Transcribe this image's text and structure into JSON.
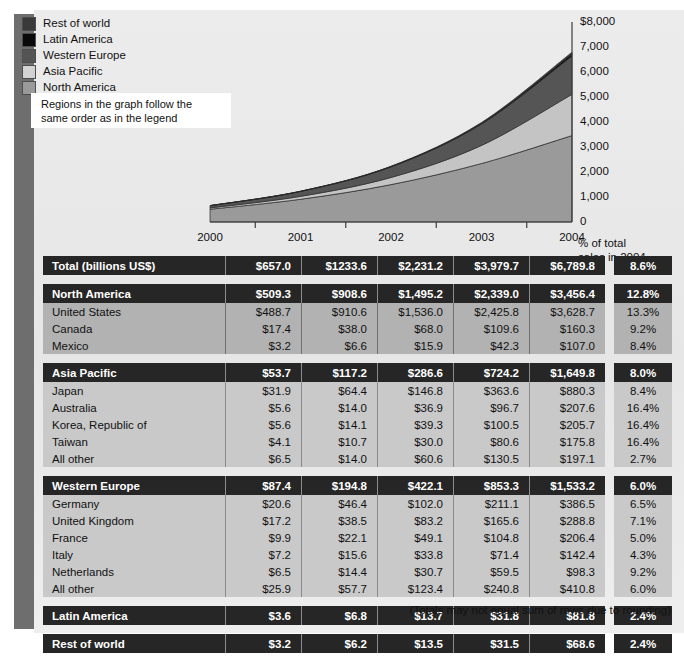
{
  "legend": {
    "items": [
      {
        "label": "Rest of world",
        "color": "#3a3a3a"
      },
      {
        "label": "Latin America",
        "color": "#0a0a0a"
      },
      {
        "label": "Western Europe",
        "color": "#555555"
      },
      {
        "label": "Asia Pacific",
        "color": "#d2d2d2"
      },
      {
        "label": "North America",
        "color": "#9a9a9a"
      }
    ]
  },
  "note": {
    "line1": "Regions in the graph follow the",
    "line2": "same order as in the legend"
  },
  "chart_data": {
    "type": "area",
    "title": "",
    "xlabel": "",
    "ylabel": "",
    "stacked": true,
    "grid": false,
    "legend_position": "top-left",
    "categories": [
      "2000",
      "2001",
      "2002",
      "2003",
      "2004"
    ],
    "x": [
      2000,
      2001,
      2002,
      2003,
      2004
    ],
    "ylim": [
      0,
      8000
    ],
    "yticks": [
      0,
      1000,
      2000,
      3000,
      4000,
      5000,
      6000,
      7000,
      8000
    ],
    "ytick_labels": [
      "0",
      "1,000",
      "2,000",
      "3,000",
      "4,000",
      "5,000",
      "6,000",
      "7,000",
      "$8,000"
    ],
    "series": [
      {
        "name": "North America",
        "color": "#9a9a9a",
        "values": [
          509.3,
          908.6,
          1495.2,
          2339.0,
          3456.4
        ]
      },
      {
        "name": "Asia Pacific",
        "color": "#c4c4c4",
        "values": [
          53.7,
          117.2,
          286.6,
          724.2,
          1649.8
        ]
      },
      {
        "name": "Western Europe",
        "color": "#555555",
        "values": [
          87.4,
          194.8,
          422.1,
          853.3,
          1533.2
        ]
      },
      {
        "name": "Latin America",
        "color": "#0a0a0a",
        "values": [
          3.6,
          6.8,
          13.7,
          31.8,
          81.8
        ]
      },
      {
        "name": "Rest of world",
        "color": "#3a3a3a",
        "values": [
          3.2,
          6.2,
          13.5,
          31.5,
          68.6
        ]
      }
    ],
    "totals": [
      657.0,
      1233.6,
      2231.2,
      3979.7,
      6789.8
    ]
  },
  "axis": {
    "y_labels": [
      "$8,000",
      "7,000",
      "6,000",
      "5,000",
      "4,000",
      "3,000",
      "2,000",
      "1,000",
      "0"
    ],
    "x_labels": [
      "2000",
      "2001",
      "2002",
      "2003",
      "2004"
    ],
    "pct_header_line1": "% of total",
    "pct_header_line2": "sales in 2004"
  },
  "table": {
    "blocks": [
      {
        "rows": [
          {
            "type": "head",
            "label": "Total (billions US$)",
            "values": [
              "$657.0",
              "$1233.6",
              "$2,231.2",
              "$3,979.7",
              "$6,789.8"
            ],
            "pct": "8.6%"
          }
        ]
      },
      {
        "rows": [
          {
            "type": "head",
            "label": "North America",
            "values": [
              "$509.3",
              "$908.6",
              "$1,495.2",
              "$2,339.0",
              "$3,456.4"
            ],
            "pct": "12.8%"
          },
          {
            "type": "sub",
            "label": "United States",
            "values": [
              "$488.7",
              "$910.6",
              "$1,536.0",
              "$2,425.8",
              "$3,628.7"
            ],
            "pct": "13.3%"
          },
          {
            "type": "sub",
            "label": "Canada",
            "values": [
              "$17.4",
              "$38.0",
              "$68.0",
              "$109.6",
              "$160.3"
            ],
            "pct": "9.2%"
          },
          {
            "type": "sub",
            "label": "Mexico",
            "values": [
              "$3.2",
              "$6.6",
              "$15.9",
              "$42.3",
              "$107.0"
            ],
            "pct": "8.4%"
          }
        ]
      },
      {
        "rows": [
          {
            "type": "head",
            "label": "Asia Pacific",
            "values": [
              "$53.7",
              "$117.2",
              "$286.6",
              "$724.2",
              "$1,649.8"
            ],
            "pct": "8.0%"
          },
          {
            "type": "sub-light",
            "label": "Japan",
            "values": [
              "$31.9",
              "$64.4",
              "$146.8",
              "$363.6",
              "$880.3"
            ],
            "pct": "8.4%"
          },
          {
            "type": "sub-light",
            "label": "Australia",
            "values": [
              "$5.6",
              "$14.0",
              "$36.9",
              "$96.7",
              "$207.6"
            ],
            "pct": "16.4%"
          },
          {
            "type": "sub-light",
            "label": "Korea, Republic of",
            "values": [
              "$5.6",
              "$14.1",
              "$39.3",
              "$100.5",
              "$205.7"
            ],
            "pct": "16.4%"
          },
          {
            "type": "sub-light",
            "label": "Taiwan",
            "values": [
              "$4.1",
              "$10.7",
              "$30.0",
              "$80.6",
              "$175.8"
            ],
            "pct": "16.4%"
          },
          {
            "type": "sub-light",
            "label": "All other",
            "values": [
              "$6.5",
              "$14.0",
              "$60.6",
              "$130.5",
              "$197.1"
            ],
            "pct": "2.7%"
          }
        ]
      },
      {
        "rows": [
          {
            "type": "head",
            "label": "Western Europe",
            "values": [
              "$87.4",
              "$194.8",
              "$422.1",
              "$853.3",
              "$1,533.2"
            ],
            "pct": "6.0%"
          },
          {
            "type": "sub-light",
            "label": "Germany",
            "values": [
              "$20.6",
              "$46.4",
              "$102.0",
              "$211.1",
              "$386.5"
            ],
            "pct": "6.5%"
          },
          {
            "type": "sub-light",
            "label": "United Kingdom",
            "values": [
              "$17.2",
              "$38.5",
              "$83.2",
              "$165.6",
              "$288.8"
            ],
            "pct": "7.1%"
          },
          {
            "type": "sub-light",
            "label": "France",
            "values": [
              "$9.9",
              "$22.1",
              "$49.1",
              "$104.8",
              "$206.4"
            ],
            "pct": "5.0%"
          },
          {
            "type": "sub-light",
            "label": "Italy",
            "values": [
              "$7.2",
              "$15.6",
              "$33.8",
              "$71.4",
              "$142.4"
            ],
            "pct": "4.3%"
          },
          {
            "type": "sub-light",
            "label": "Netherlands",
            "values": [
              "$6.5",
              "$14.4",
              "$30.7",
              "$59.5",
              "$98.3"
            ],
            "pct": "9.2%"
          },
          {
            "type": "sub-light",
            "label": "All other",
            "values": [
              "$25.9",
              "$57.7",
              "$123.4",
              "$240.8",
              "$410.8"
            ],
            "pct": "6.0%"
          }
        ]
      },
      {
        "rows": [
          {
            "type": "head",
            "label": "Latin America",
            "values": [
              "$3.6",
              "$6.8",
              "$13.7",
              "$31.8",
              "$81.8"
            ],
            "pct": "2.4%"
          }
        ]
      },
      {
        "rows": [
          {
            "type": "head",
            "label": "Rest of world",
            "values": [
              "$3.2",
              "$6.2",
              "$13.5",
              "$31.5",
              "$68.6"
            ],
            "pct": "2.4%"
          }
        ]
      }
    ]
  },
  "footnote": "(Totals may not equal sum of rows due to rounding)"
}
